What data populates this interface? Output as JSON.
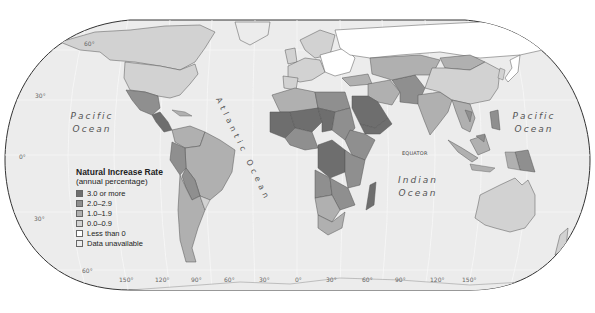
{
  "map": {
    "title": "Natural Increase Rate",
    "subtitle": "(annual percentage)",
    "projection": "Robinson-like world map (grayscale)",
    "legend": {
      "title": "Natural Increase Rate",
      "subtitle": "(annual percentage)",
      "items": [
        {
          "label": "3.0 or more",
          "color": "#6e6e6e"
        },
        {
          "label": "2.0–2.9",
          "color": "#8f8f8f"
        },
        {
          "label": "1.0–1.9",
          "color": "#b0b0b0"
        },
        {
          "label": "0.0–0.9",
          "color": "#d2d2d2"
        },
        {
          "label": "Less than 0",
          "color": "#ffffff"
        },
        {
          "label": "Data unavailable",
          "color": "#ececec"
        }
      ]
    },
    "ocean_labels": {
      "pacific_west_line1": "Pacific",
      "pacific_west_line2": "Ocean",
      "pacific_east_line1": "Pacific",
      "pacific_east_line2": "Ocean",
      "atlantic": "Atlantic Ocean",
      "indian_line1": "Indian",
      "indian_line2": "Ocean"
    },
    "equator_label": "EQUATOR",
    "latitude_labels": {
      "lat60n": "60°",
      "lat30n": "30°",
      "lat0": "0°",
      "lat30s": "30°",
      "lat60s": "60°"
    },
    "longitude_labels": [
      "150°",
      "120°",
      "90°",
      "60°",
      "30°",
      "0°",
      "30°",
      "60°",
      "90°",
      "120°",
      "150°"
    ],
    "colors": {
      "ocean": "#ededed",
      "border": "#444444",
      "graticule": "#fafafa"
    }
  }
}
